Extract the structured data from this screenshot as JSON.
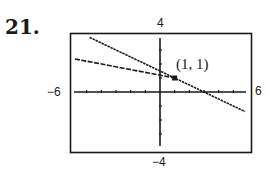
{
  "problem_number": "21.",
  "chart_data": {
    "type": "line",
    "title": "",
    "xlabel": "",
    "ylabel": "",
    "xlim": [
      -6,
      6
    ],
    "ylim": [
      -4,
      4
    ],
    "x_tick_step": 1,
    "y_tick_step": 1,
    "window_labels": {
      "xmin": "−6",
      "xmax": "6",
      "ymin": "−4",
      "ymax": "4"
    },
    "grid": false,
    "series": [
      {
        "name": "line-1",
        "style": "dotted-solid",
        "x": [
          -4.8,
          5.8
        ],
        "y": [
          3.9,
          -1.4
        ],
        "equation": "y = -0.5x + 1.5"
      },
      {
        "name": "line-2",
        "style": "dashed",
        "x": [
          -5.8,
          1
        ],
        "y": [
          2.36,
          1
        ],
        "equation": "y = -0.2x + 1.2"
      }
    ],
    "annotations": [
      {
        "text": "(1, 1)",
        "x": 1,
        "y": 1,
        "marker": "square"
      }
    ]
  },
  "colors": {
    "ink": "#1a1a1a",
    "background": "#ffffff"
  }
}
